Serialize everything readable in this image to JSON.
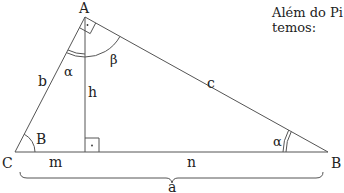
{
  "diagram": {
    "vertices": {
      "A": "A",
      "B": "B",
      "C": "C"
    },
    "sides": {
      "a": "a",
      "b": "b",
      "c": "c",
      "h": "h",
      "m": "m",
      "n": "n"
    },
    "angles": {
      "alpha_at_A": "α",
      "beta_at_A": "β",
      "angle_at_C": "B",
      "alpha_at_B": "α"
    },
    "right_angle_marks": [
      "at A",
      "at foot of altitude"
    ],
    "colors": {
      "stroke": "#555555",
      "text": "#222222",
      "background": "#ffffff"
    }
  },
  "side_text": {
    "line1": "Além do Pi",
    "line2": "temos:"
  }
}
